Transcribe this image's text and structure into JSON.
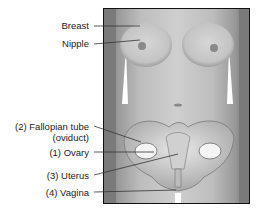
{
  "diagram": {
    "labels": [
      {
        "id": "breast",
        "text": "Breast"
      },
      {
        "id": "nipple",
        "text": "Nipple"
      },
      {
        "id": "fallopian",
        "text": "(2) Fallopian tube",
        "text2": "(oviduct)"
      },
      {
        "id": "ovary",
        "text": "(1) Ovary"
      },
      {
        "id": "uterus",
        "text": "(3) Uterus"
      },
      {
        "id": "vagina",
        "text": "(4) Vagina"
      }
    ],
    "colors": {
      "line": "#333333",
      "frame": "#111111",
      "text": "#222222"
    }
  }
}
